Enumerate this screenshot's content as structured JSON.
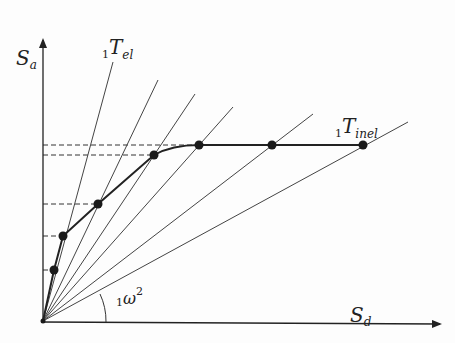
{
  "diagram": {
    "type": "capacity-spectrum",
    "axes": {
      "y_label": {
        "main": "S",
        "sub": "a"
      },
      "x_label": {
        "main": "S",
        "sub": "d"
      }
    },
    "labels": {
      "elastic_period": {
        "prefix": "1",
        "main": "T",
        "sub": "el"
      },
      "inelastic_period": {
        "prefix": "1",
        "main": "T",
        "sub": "inel"
      },
      "angle": {
        "prefix": "1",
        "main": "ω",
        "sup": "2"
      }
    },
    "origin": [
      43,
      321
    ],
    "ray_ends": [
      [
        113,
        62
      ],
      [
        158,
        80
      ],
      [
        195,
        94
      ],
      [
        233,
        107
      ],
      [
        313,
        114
      ],
      [
        408,
        122
      ]
    ],
    "curve_points": [
      [
        54,
        270
      ],
      [
        63,
        236
      ],
      [
        98,
        204
      ],
      [
        154,
        155
      ],
      [
        199,
        145
      ],
      [
        272,
        145
      ],
      [
        363,
        145
      ]
    ],
    "dashed_levels_y": [
      145,
      155,
      204,
      236,
      270
    ],
    "colors": {
      "line": "#333333",
      "curve": "#222222",
      "point": "#1a1a1a"
    }
  }
}
